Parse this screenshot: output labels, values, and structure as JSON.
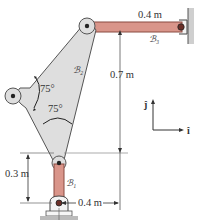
{
  "figure": {
    "link_b1": {
      "label": "ℬ₁",
      "length_label": "0.3 m"
    },
    "link_b2": {
      "label": "ℬ₂",
      "angle_top": "75°",
      "angle_bottom": "75°"
    },
    "link_b3": {
      "label": "ℬ₃",
      "length_label": "0.4 m"
    },
    "dim_vertical": "0.7 m",
    "dim_horizontal": "0.4 m",
    "axes": {
      "j": "ĵ",
      "i": "î"
    },
    "colors": {
      "link_fill": "#d9958a",
      "link_stroke": "#8a4a40",
      "plate_fill": "#dedede",
      "plate_stroke": "#555555",
      "dim_line": "#444444",
      "ground": "#bbbbbb"
    }
  }
}
